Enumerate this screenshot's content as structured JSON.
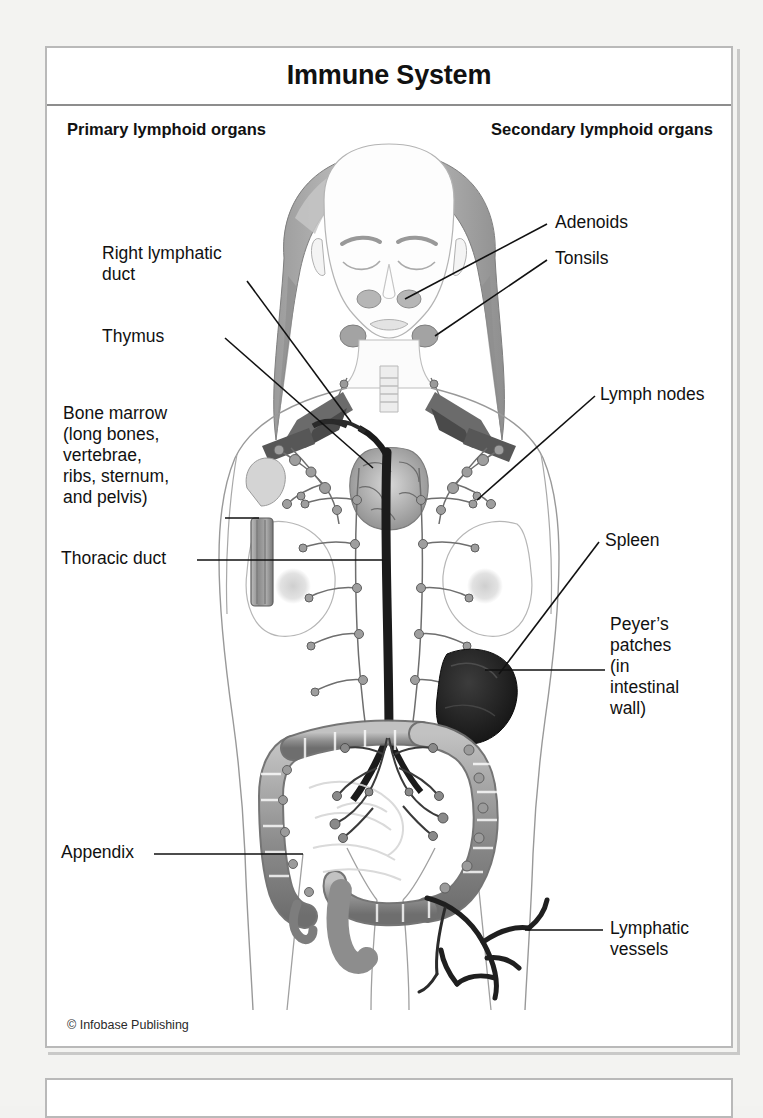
{
  "page": {
    "background_color": "#f3f3f1",
    "panel_background": "#ffffff",
    "panel_border_color": "#b9b9b9"
  },
  "figure": {
    "title": "Immune System",
    "subheading_left": "Primary lymphoid organs",
    "subheading_right": "Secondary lymphoid organs",
    "credit": "© Infobase Publishing",
    "line_color": "#1a1a1a",
    "text_color": "#111111"
  },
  "labels": {
    "primary": [
      {
        "id": "right-lymphatic-duct",
        "text": "Right lymphatic\nduct"
      },
      {
        "id": "thymus",
        "text": "Thymus"
      },
      {
        "id": "bone-marrow",
        "text": "Bone marrow\n(long bones,\nvertebrae,\nribs, sternum,\nand pelvis)"
      },
      {
        "id": "thoracic-duct",
        "text": "Thoracic duct"
      },
      {
        "id": "appendix",
        "text": "Appendix"
      }
    ],
    "secondary": [
      {
        "id": "adenoids",
        "text": "Adenoids"
      },
      {
        "id": "tonsils",
        "text": "Tonsils"
      },
      {
        "id": "lymph-nodes",
        "text": "Lymph nodes"
      },
      {
        "id": "spleen",
        "text": "Spleen"
      },
      {
        "id": "peyers-patches",
        "text": "Peyer’s\npatches\n(in\nintestinal\nwall)"
      },
      {
        "id": "lymphatic-vessels",
        "text": "Lymphatic\nvessels"
      }
    ]
  }
}
